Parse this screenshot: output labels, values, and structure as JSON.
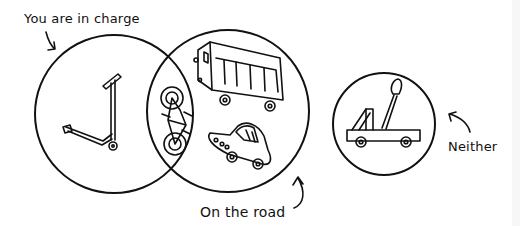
{
  "diagram": {
    "type": "venn",
    "labels": {
      "left_set": "You are in charge",
      "middle_set": "On the road",
      "outside": "Neither"
    },
    "regions": [
      {
        "region": "You are in charge only",
        "items": [
          "kick scooter"
        ]
      },
      {
        "region": "Both (You are in charge AND On the road)",
        "items": [
          "bicycle"
        ]
      },
      {
        "region": "On the road only",
        "items": [
          "bus",
          "car"
        ]
      },
      {
        "region": "Neither",
        "items": [
          "catapult on wheels"
        ]
      }
    ],
    "colors": {
      "ink": "#111111",
      "background": "#ffffff",
      "edge_strip": "#f7f7f7"
    }
  }
}
